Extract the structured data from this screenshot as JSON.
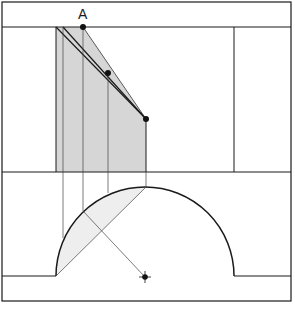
{
  "diagram": {
    "title_label": "A",
    "label_position": {
      "x": 77,
      "y": 6
    },
    "colors": {
      "line": "#1a1a1a",
      "thin_line": "#444444",
      "shade": "#d6d6d6",
      "lens_shade": "#eeeeee",
      "background": "#ffffff"
    },
    "frame": {
      "x1": 2,
      "y1": 2,
      "x2": 291,
      "y2": 301
    },
    "horizontal_lines": [
      {
        "name": "top-line",
        "x1": 2,
        "y1": 27,
        "x2": 291,
        "y2": 27
      },
      {
        "name": "middle-line",
        "x1": 2,
        "y1": 172,
        "x2": 291,
        "y2": 172
      },
      {
        "name": "bottom-left-line",
        "x1": 2,
        "y1": 276,
        "x2": 56,
        "y2": 276
      },
      {
        "name": "bottom-right-line",
        "x1": 234,
        "y1": 276,
        "x2": 291,
        "y2": 276
      }
    ],
    "right_vertical": {
      "x1": 234,
      "y1": 27,
      "x2": 234,
      "y2": 172
    },
    "shaded_region": [
      [
        56,
        27
      ],
      [
        83,
        27
      ],
      [
        146,
        119
      ],
      [
        146,
        172
      ],
      [
        56,
        172
      ]
    ],
    "points": [
      {
        "name": "point-a",
        "x": 83,
        "y": 27
      },
      {
        "name": "point-mid",
        "x": 108,
        "y": 73
      },
      {
        "name": "point-right",
        "x": 146,
        "y": 119
      },
      {
        "name": "center-point",
        "x": 145,
        "y": 277
      }
    ],
    "arc": {
      "cx": 145,
      "cy": 276,
      "r": 89
    }
  }
}
